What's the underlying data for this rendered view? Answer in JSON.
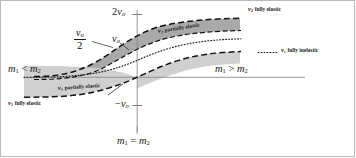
{
  "figure": {
    "frame_color": "#b9b9b9",
    "background": "#ffffff"
  },
  "axes": {
    "vertical_axis_name": "v",
    "horizontal_axis_color": "#8a8a8a",
    "vertical_axis_color": "#8a8a8a",
    "y_ticks": [
      {
        "id": "tick-2v0",
        "label_main": "2",
        "label_var": "v",
        "label_sub": "o",
        "value": "2v_o"
      },
      {
        "id": "tick-neg-v0",
        "label_main": "−",
        "label_var": "v",
        "label_sub": "o",
        "value": "-v_o"
      }
    ],
    "x_left_label": {
      "m1": "m",
      "sub1": "1",
      "rel": "<",
      "m2": "m",
      "sub2": "2",
      "text": "m1 < m2"
    },
    "x_right_label": {
      "m1": "m",
      "sub1": "1",
      "rel": ">",
      "m2": "m",
      "sub2": "2",
      "text": "m1 > m2"
    },
    "x_center_label": {
      "m1": "m",
      "sub1": "1",
      "rel": "=",
      "m2": "m",
      "sub2": "2",
      "text": "m1 = m2"
    },
    "fraction_label": {
      "numerator_var": "v",
      "numerator_sub": "o",
      "denominator": "2",
      "text": "v_o / 2"
    },
    "v_label": {
      "var": "v",
      "sub": "o",
      "text": "v_o"
    }
  },
  "curves": [
    {
      "id": "v2-fully-elastic",
      "label_var": "v",
      "label_sub": "2",
      "label_name": "fully elastic",
      "style": "dashed",
      "color": "#111111"
    },
    {
      "id": "v2-partially-elastic",
      "label_var": "v",
      "label_sub": "2",
      "label_name": "partially elastic",
      "style": "dashed-on-shade",
      "color": "#111111"
    },
    {
      "id": "vc-fully-inelastic",
      "label_var": "v",
      "label_sub": "c",
      "label_name": "fully inelastic",
      "style": "dotted",
      "color": "#111111"
    },
    {
      "id": "v1-partially-elastic",
      "label_var": "v",
      "label_sub": "1",
      "label_name": "partially elastic",
      "style": "dashed-on-shade",
      "color": "#111111"
    },
    {
      "id": "v1-fully-elastic",
      "label_var": "v",
      "label_sub": "1",
      "label_name": "fully elastic",
      "style": "dashed",
      "color": "#111111"
    }
  ],
  "legend": {
    "items": [
      {
        "id": "legend-vc-fully-inelastic",
        "marker": "dotted",
        "var": "v",
        "sub": "c",
        "name": "fully inelastic"
      }
    ]
  },
  "shading": {
    "upper_band_color": "#a8a8a8",
    "lower_band_color": "#cfcfcf"
  }
}
